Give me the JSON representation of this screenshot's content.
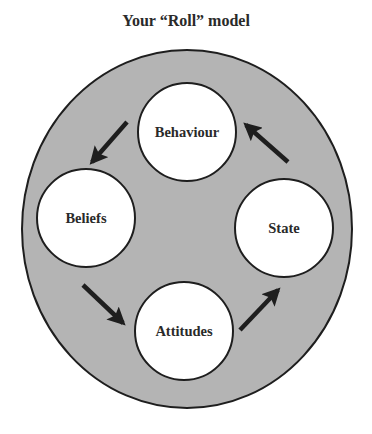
{
  "title": "Your “Roll” model",
  "colors": {
    "background": "#ffffff",
    "outer_fill": "#b4b4b4",
    "stroke": "#1e1e1e",
    "node_fill": "#ffffff",
    "text": "#2a2a2a",
    "arrow": "#1e1e1e"
  },
  "outer": {
    "cx": 187,
    "cy": 229,
    "rx": 165,
    "ry": 179
  },
  "nodes": [
    {
      "id": "behaviour",
      "label": "Behaviour",
      "cx": 187,
      "cy": 132,
      "r": 49
    },
    {
      "id": "beliefs",
      "label": "Beliefs",
      "cx": 86,
      "cy": 218,
      "r": 49
    },
    {
      "id": "attitudes",
      "label": "Attitudes",
      "cx": 184,
      "cy": 331,
      "r": 49
    },
    {
      "id": "state",
      "label": "State",
      "cx": 284,
      "cy": 228,
      "r": 49
    }
  ],
  "edges": [
    {
      "from": "behaviour",
      "to": "beliefs",
      "x1": 127,
      "y1": 122,
      "x2": 92,
      "y2": 162
    },
    {
      "from": "beliefs",
      "to": "attitudes",
      "x1": 83,
      "y1": 285,
      "x2": 123,
      "y2": 323
    },
    {
      "from": "attitudes",
      "to": "state",
      "x1": 240,
      "y1": 330,
      "x2": 278,
      "y2": 290
    },
    {
      "from": "state",
      "to": "behaviour",
      "x1": 288,
      "y1": 162,
      "x2": 246,
      "y2": 125
    }
  ]
}
